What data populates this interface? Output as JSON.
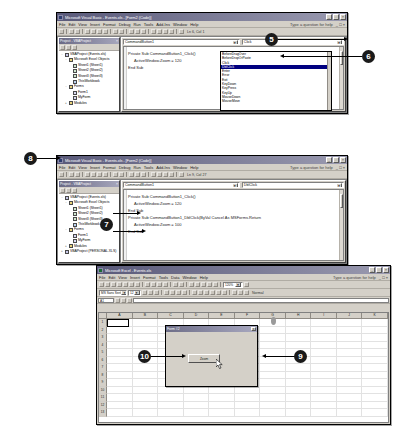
{
  "vbe_window_1": {
    "title": "Microsoft Visual Basic - Events.xls - [Form2 (Code)]",
    "menu": [
      "File",
      "Edit",
      "View",
      "Insert",
      "Format",
      "Debug",
      "Run",
      "Tools",
      "Add-Ins",
      "Window",
      "Help"
    ],
    "ask_box": "Type a question for help",
    "toolbar_status": "Ln 6, Col 1",
    "project_panel": {
      "title": "Project - VBAProject",
      "tree": [
        {
          "label": "VBAProject (Events.xls)",
          "indent": 0,
          "icon": "proj-icon",
          "twisty": "-"
        },
        {
          "label": "Microsoft Excel Objects",
          "indent": 1,
          "icon": "folder-icon",
          "twisty": "-"
        },
        {
          "label": "Sheet1 (Sheet1)",
          "indent": 2,
          "icon": "sheet-icon",
          "twisty": ""
        },
        {
          "label": "Sheet2 (Sheet2)",
          "indent": 2,
          "icon": "sheet-icon",
          "twisty": ""
        },
        {
          "label": "Sheet3 (Sheet3)",
          "indent": 2,
          "icon": "sheet-icon",
          "twisty": ""
        },
        {
          "label": "ThisWorkbook",
          "indent": 2,
          "icon": "book-icon",
          "twisty": ""
        },
        {
          "label": "Forms",
          "indent": 1,
          "icon": "folder-icon",
          "twisty": "-"
        },
        {
          "label": "Form1",
          "indent": 2,
          "icon": "form-icon",
          "twisty": ""
        },
        {
          "label": "MyForm",
          "indent": 2,
          "icon": "form-icon",
          "twisty": ""
        },
        {
          "label": "Modules",
          "indent": 1,
          "icon": "folder-icon",
          "twisty": "+"
        }
      ]
    },
    "object_combo": "CommandButton1",
    "procedure_combo": "Click",
    "event_dropdown": {
      "options": [
        "BeforeDragOver",
        "BeforeDropOrPaste",
        "Click",
        "DblClick",
        "Enter",
        "Error",
        "Exit",
        "KeyDown",
        "KeyPress",
        "KeyUp",
        "MouseDown",
        "MouseMove"
      ],
      "selected": "DblClick"
    },
    "code": [
      {
        "text": "Private Sub CommandButton1_Click()",
        "indent": false
      },
      {
        "text": "",
        "indent": false
      },
      {
        "text": "ActiveWindow.Zoom = 120",
        "indent": true
      },
      {
        "text": "",
        "indent": false
      },
      {
        "text": "End Sub",
        "indent": false
      }
    ]
  },
  "vbe_window_2": {
    "title": "Microsoft Visual Basic - Events.xls - [Form2 (Code)]",
    "menu": [
      "File",
      "Edit",
      "View",
      "Insert",
      "Format",
      "Debug",
      "Run",
      "Tools",
      "Add-Ins",
      "Window",
      "Help"
    ],
    "ask_box": "Type a question for help",
    "toolbar_status": "Ln 9, Col 27",
    "project_panel": {
      "title": "Project - VBAProject",
      "tree": [
        {
          "label": "VBAProject (Events.xls)",
          "indent": 0,
          "icon": "proj-icon",
          "twisty": "-"
        },
        {
          "label": "Microsoft Excel Objects",
          "indent": 1,
          "icon": "folder-icon",
          "twisty": "-"
        },
        {
          "label": "Sheet1 (Sheet1)",
          "indent": 2,
          "icon": "sheet-icon",
          "twisty": ""
        },
        {
          "label": "Sheet2 (Sheet2)",
          "indent": 2,
          "icon": "sheet-icon",
          "twisty": ""
        },
        {
          "label": "Sheet3 (Sheet3)",
          "indent": 2,
          "icon": "sheet-icon",
          "twisty": ""
        },
        {
          "label": "ThisWorkbook",
          "indent": 2,
          "icon": "book-icon",
          "twisty": ""
        },
        {
          "label": "Forms",
          "indent": 1,
          "icon": "folder-icon",
          "twisty": "-"
        },
        {
          "label": "Form1",
          "indent": 2,
          "icon": "form-icon",
          "twisty": ""
        },
        {
          "label": "MyForm",
          "indent": 2,
          "icon": "form-icon",
          "twisty": ""
        },
        {
          "label": "Modules",
          "indent": 1,
          "icon": "folder-icon",
          "twisty": "+"
        },
        {
          "label": "VBAProject (PERSONAL.XLS)",
          "indent": 0,
          "icon": "proj-icon",
          "twisty": "+"
        }
      ]
    },
    "object_combo": "CommandButton1",
    "procedure_combo": "DblClick",
    "code": [
      {
        "text": "Private Sub CommandButton1_Click()",
        "indent": false
      },
      {
        "text": "",
        "indent": false
      },
      {
        "text": "ActiveWindow.Zoom = 120",
        "indent": true
      },
      {
        "text": "",
        "indent": false
      },
      {
        "text": "End Sub",
        "indent": false
      },
      {
        "text": "",
        "indent": false
      },
      {
        "text": "Private Sub CommandButton1_DblClick(ByVal Cancel As MSForms.Return",
        "indent": false
      },
      {
        "text": "",
        "indent": false
      },
      {
        "text": "ActiveWindow.Zoom = 100",
        "indent": true
      },
      {
        "text": "",
        "indent": false
      },
      {
        "text": "End Sub",
        "indent": false
      }
    ]
  },
  "excel_window": {
    "title": "Microsoft Excel - Events.xls",
    "menu": [
      "File",
      "Edit",
      "View",
      "Insert",
      "Format",
      "Tools",
      "Data",
      "Window",
      "Help"
    ],
    "ask_box": "Type a question for help",
    "zoom_value": "120%",
    "font_name": "MS Sans Serif",
    "font_size": "12",
    "name_box": "A1",
    "formula_value": "",
    "columns": [
      "A",
      "B",
      "C",
      "D",
      "E",
      "F",
      "G",
      "H",
      "I",
      "J",
      "K"
    ],
    "rows": [
      "1",
      "2",
      "3",
      "4",
      "5",
      "6",
      "7",
      "8",
      "9",
      "10",
      "11",
      "12",
      "13"
    ],
    "userform": {
      "title": "Form #2",
      "close_label": "x",
      "button_label": "Zoom"
    }
  },
  "callouts": [
    {
      "number": "5"
    },
    {
      "number": "6"
    },
    {
      "number": "7"
    },
    {
      "number": "8"
    },
    {
      "number": "9"
    },
    {
      "number": "10"
    }
  ]
}
